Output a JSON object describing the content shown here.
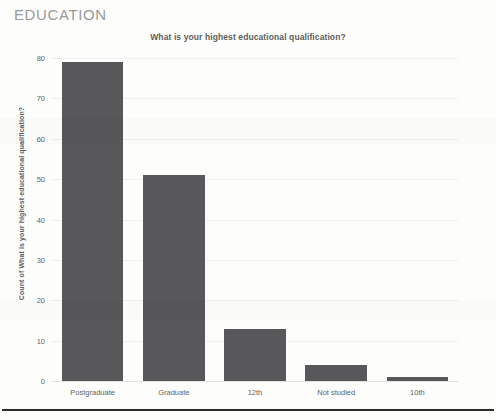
{
  "section": {
    "heading": "EDUCATION"
  },
  "chart_data": {
    "type": "bar",
    "title": "What is your highest educational qualification?",
    "xlabel": "",
    "ylabel": "Count of What is your highest educational qualification?",
    "categories": [
      "Postgraduate",
      "Graduate",
      "12th",
      "Not studied",
      "10th"
    ],
    "values": [
      79,
      51,
      13,
      4,
      1
    ],
    "ylim": [
      0,
      80
    ],
    "yticks": [
      0,
      10,
      20,
      30,
      40,
      50,
      60,
      70,
      80
    ],
    "ytick_labels": [
      "0",
      "10",
      "20",
      "30",
      "40",
      "50",
      "60",
      "70",
      "80"
    ],
    "grid": true,
    "legend": false,
    "bar_color": "#58585a",
    "text_color": "#5d5d5d",
    "tick_color": "#636363",
    "gridline_color": "#f0f0ef"
  }
}
